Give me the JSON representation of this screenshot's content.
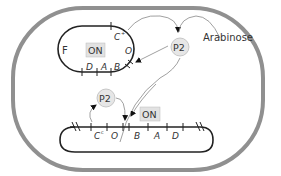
{
  "diagram": {
    "type": "genetic-regulation",
    "colors": {
      "cell_wall": "#8f8f8f",
      "dna": "#222222",
      "arrow": "#888888",
      "p2_fill": "#e6e6e6",
      "on_box_fill": "#e2e2e2"
    },
    "plasmid": {
      "label": "F",
      "on_label": "ON",
      "genes": [
        "C",
        "O",
        "D",
        "A",
        "B"
      ],
      "c_label": "C",
      "c_sup": "+",
      "o_label": "O",
      "d_label": "D",
      "a_label": "A",
      "b_label": "B"
    },
    "chromosome": {
      "on_label": "ON",
      "c_label": "C",
      "c_sup": "c",
      "o_label": "O",
      "b_label": "B",
      "a_label": "A",
      "d_label": "D"
    },
    "protein_upper": {
      "label": "P2"
    },
    "protein_lower": {
      "label": "P2"
    },
    "inducer": {
      "label": "Arabinose"
    }
  }
}
